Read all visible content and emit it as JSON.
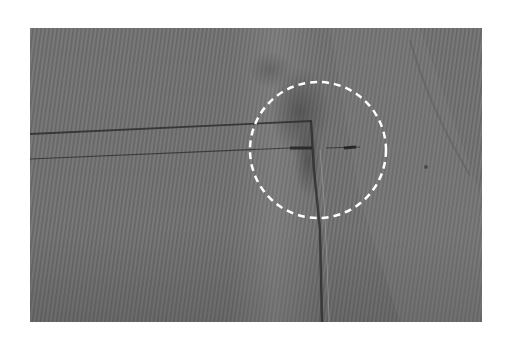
{
  "image": {
    "kind": "photograph",
    "subject": "close-up of gray woven fabric with a stitched seam junction",
    "background_color": "#ffffff",
    "photo_box": {
      "x": 30,
      "y": 28,
      "width": 452,
      "height": 294
    },
    "colors": {
      "fabric_base": "#727272",
      "fabric_dark": "#5a5a5a",
      "fabric_light": "#878787",
      "stitch": "#2e2e2e",
      "annotation": "#ffffff"
    }
  },
  "annotation": {
    "shape": "dashed-circle",
    "center": {
      "x": 318,
      "y": 150
    },
    "radius": 68,
    "stroke_width": 2.5,
    "dash": "7 5",
    "marks": "seam junction where horizontal stitching meets vertical seam"
  },
  "stitch_lines": [
    {
      "name": "upper-horizontal",
      "from": [
        30,
        134
      ],
      "to": [
        312,
        121
      ]
    },
    {
      "name": "lower-horizontal",
      "from": [
        30,
        159
      ],
      "to": [
        360,
        147
      ]
    },
    {
      "name": "vertical-seam-a",
      "from": [
        312,
        121
      ],
      "to": [
        322,
        322
      ]
    },
    {
      "name": "vertical-seam-b",
      "from": [
        322,
        150
      ],
      "to": [
        330,
        322
      ]
    }
  ]
}
